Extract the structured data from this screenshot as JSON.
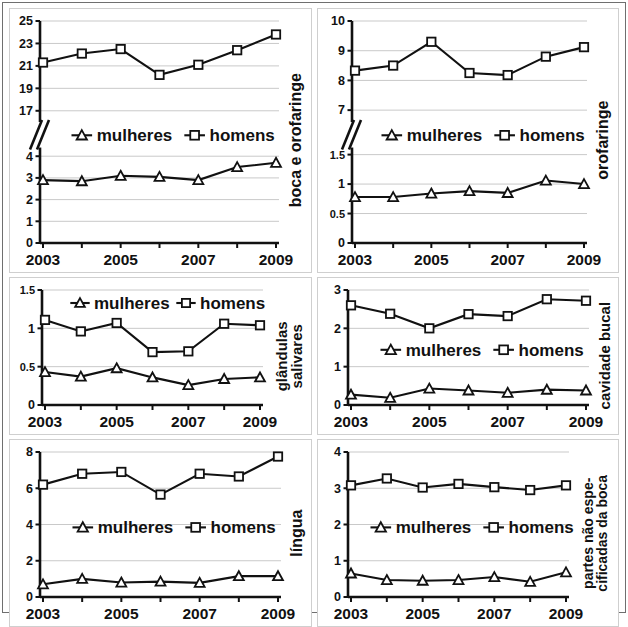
{
  "figure": {
    "legend": {
      "mulheres_label": "mulheres",
      "homens_label": "homens",
      "mulheres_marker": "triangle-open-marker",
      "homens_marker": "square-open-marker"
    },
    "xaxis": {
      "years": [
        2003,
        2004,
        2005,
        2006,
        2007,
        2008,
        2009
      ],
      "visible_tick_labels": [
        "2003",
        "2005",
        "2007",
        "2009"
      ]
    },
    "colors": {
      "ink": "#111111",
      "grid": "#c9c9c9",
      "panel_border": "#cfcfcf",
      "frame": "#6f6f6f",
      "marker_fill": "#ffffff"
    }
  },
  "chart_data": [
    {
      "id": "boca-e-orofaringe",
      "type": "line",
      "title": "",
      "ylabel": "boca e orofaringe",
      "xlabel": "",
      "broken_axis": true,
      "x": [
        2003,
        2004,
        2005,
        2006,
        2007,
        2008,
        2009
      ],
      "xtick_labels": [
        "2003",
        "",
        "2005",
        "",
        "2007",
        "",
        "2009"
      ],
      "upper_segment": {
        "ylim": [
          16,
          25
        ],
        "yticks": [
          17,
          19,
          21,
          23,
          25
        ],
        "ytick_labels": [
          "17",
          "19",
          "21",
          "23",
          "25"
        ]
      },
      "lower_segment": {
        "ylim": [
          0,
          4.4
        ],
        "yticks": [
          0,
          1,
          2,
          3,
          4
        ],
        "ytick_labels": [
          "0",
          "1",
          "2",
          "3",
          "4"
        ]
      },
      "series": [
        {
          "name": "homens",
          "segment": "upper",
          "marker": "square",
          "values": [
            21.3,
            22.1,
            22.5,
            20.2,
            21.1,
            22.4,
            23.8
          ]
        },
        {
          "name": "mulheres",
          "segment": "lower",
          "marker": "triangle",
          "values": [
            2.9,
            2.85,
            3.1,
            3.05,
            2.9,
            3.5,
            3.7
          ]
        }
      ],
      "grid": true,
      "legend_position": "middle"
    },
    {
      "id": "orofaringe",
      "type": "line",
      "title": "",
      "ylabel": "orofaringe",
      "xlabel": "",
      "broken_axis": true,
      "x": [
        2003,
        2004,
        2005,
        2006,
        2007,
        2008,
        2009
      ],
      "xtick_labels": [
        "2003",
        "",
        "2005",
        "",
        "2007",
        "",
        "2009"
      ],
      "upper_segment": {
        "ylim": [
          6.6,
          10
        ],
        "yticks": [
          7,
          8,
          9,
          10
        ],
        "ytick_labels": [
          "7",
          "8",
          "9",
          "10"
        ]
      },
      "lower_segment": {
        "ylim": [
          0,
          1.62
        ],
        "yticks": [
          0,
          0.5,
          1,
          1.5
        ],
        "ytick_labels": [
          "0",
          "0.5",
          "1",
          "1.5"
        ]
      },
      "series": [
        {
          "name": "homens",
          "segment": "upper",
          "marker": "square",
          "values": [
            8.33,
            8.5,
            9.3,
            8.25,
            8.18,
            8.8,
            9.12
          ]
        },
        {
          "name": "mulheres",
          "segment": "lower",
          "marker": "triangle",
          "values": [
            0.78,
            0.78,
            0.84,
            0.88,
            0.85,
            1.06,
            1.0
          ]
        }
      ],
      "grid": true,
      "legend_position": "middle"
    },
    {
      "id": "glandulas-salivares",
      "type": "line",
      "title": "",
      "ylabel": "glândulas salivares",
      "ylabel_lines": [
        "glândulas",
        "salivares"
      ],
      "xlabel": "",
      "broken_axis": false,
      "x": [
        2003,
        2004,
        2005,
        2006,
        2007,
        2008,
        2009
      ],
      "xtick_labels": [
        "2003",
        "",
        "2005",
        "",
        "2007",
        "",
        "2009"
      ],
      "ylim": [
        0,
        1.5
      ],
      "yticks": [
        0,
        0.5,
        1,
        1.5
      ],
      "ytick_labels": [
        "0",
        "0.5",
        "1",
        "1.5"
      ],
      "series": [
        {
          "name": "homens",
          "marker": "square",
          "values": [
            1.11,
            0.96,
            1.07,
            0.69,
            0.7,
            1.06,
            1.04
          ]
        },
        {
          "name": "mulheres",
          "marker": "triangle",
          "values": [
            0.43,
            0.37,
            0.48,
            0.36,
            0.26,
            0.34,
            0.36
          ]
        }
      ],
      "grid": true,
      "legend_position": "top"
    },
    {
      "id": "cavidade-bucal",
      "type": "line",
      "title": "",
      "ylabel": "cavidade bucal",
      "xlabel": "",
      "broken_axis": false,
      "x": [
        2003,
        2004,
        2005,
        2006,
        2007,
        2008,
        2009
      ],
      "xtick_labels": [
        "2003",
        "",
        "2005",
        "",
        "2007",
        "",
        "2009"
      ],
      "ylim": [
        0,
        3
      ],
      "yticks": [
        0,
        1,
        2,
        3
      ],
      "ytick_labels": [
        "0",
        "1",
        "2",
        "3"
      ],
      "series": [
        {
          "name": "homens",
          "marker": "square",
          "values": [
            2.6,
            2.38,
            2.0,
            2.37,
            2.32,
            2.76,
            2.72
          ]
        },
        {
          "name": "mulheres",
          "marker": "triangle",
          "values": [
            0.27,
            0.19,
            0.43,
            0.38,
            0.32,
            0.4,
            0.38
          ]
        }
      ],
      "grid": true,
      "legend_position": "middle"
    },
    {
      "id": "lingua",
      "type": "line",
      "title": "",
      "ylabel": "língua",
      "xlabel": "",
      "broken_axis": false,
      "x": [
        2003,
        2004,
        2005,
        2006,
        2007,
        2008,
        2009
      ],
      "xtick_labels": [
        "2003",
        "",
        "2005",
        "",
        "2007",
        "",
        "2009"
      ],
      "ylim": [
        0,
        8
      ],
      "yticks": [
        0,
        2,
        4,
        6,
        8
      ],
      "ytick_labels": [
        "0",
        "2",
        "4",
        "6",
        "8"
      ],
      "series": [
        {
          "name": "homens",
          "marker": "square",
          "values": [
            6.2,
            6.8,
            6.9,
            5.65,
            6.8,
            6.65,
            7.75
          ]
        },
        {
          "name": "mulheres",
          "marker": "triangle",
          "values": [
            0.7,
            1.0,
            0.8,
            0.85,
            0.78,
            1.15,
            1.15
          ]
        }
      ],
      "grid": true,
      "legend_position": "middle"
    },
    {
      "id": "partes-nao-especificadas-da-boca",
      "type": "line",
      "title": "",
      "ylabel": "partes não espe-cificadas da boca",
      "ylabel_lines": [
        "partes não espe-",
        "cificadas da boca"
      ],
      "xlabel": "",
      "broken_axis": false,
      "x": [
        2003,
        2004,
        2005,
        2006,
        2007,
        2008,
        2009
      ],
      "xtick_labels": [
        "2003",
        "",
        "2005",
        "",
        "2007",
        "",
        "2009"
      ],
      "ylim": [
        0,
        4
      ],
      "yticks": [
        0,
        1,
        2,
        3,
        4
      ],
      "ytick_labels": [
        "0",
        "1",
        "2",
        "3",
        "4"
      ],
      "series": [
        {
          "name": "homens",
          "marker": "square",
          "values": [
            3.08,
            3.27,
            3.02,
            3.12,
            3.03,
            2.95,
            3.08
          ]
        },
        {
          "name": "mulheres",
          "marker": "triangle",
          "values": [
            0.65,
            0.47,
            0.45,
            0.47,
            0.55,
            0.42,
            0.68
          ]
        }
      ],
      "grid": true,
      "legend_position": "middle"
    }
  ]
}
